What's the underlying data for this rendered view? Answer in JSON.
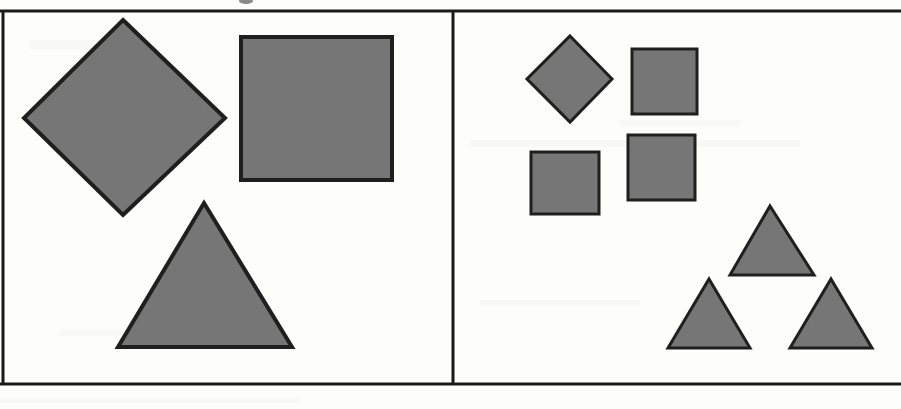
{
  "figure": {
    "title": "",
    "width": 901,
    "height": 409,
    "background_color": "#fdfdfc",
    "shape_fill_color": "#767676",
    "shape_stroke_color": "#1f1f1f",
    "frame_color": "#1a1a1a"
  },
  "frame": {
    "top_rule": {
      "x1": 0,
      "y1": 11,
      "x2": 901,
      "y2": 11,
      "width": 3
    },
    "bottom_rule": {
      "x1": 0,
      "y1": 384,
      "x2": 901,
      "y2": 384,
      "width": 3
    },
    "left_rule": {
      "x1": 3,
      "y1": 11,
      "x2": 3,
      "y2": 384,
      "width": 3
    },
    "divider_rule": {
      "x1": 453,
      "y1": 11,
      "x2": 453,
      "y2": 384,
      "width": 3
    }
  },
  "panels": [
    {
      "name": "left-panel",
      "label": "",
      "shape_count": 3,
      "shapes": [
        {
          "name": "large-diamond",
          "type": "diamond",
          "points": "123,20 225,118 123,215 24,118",
          "stroke_width": 4,
          "size": "large"
        },
        {
          "name": "large-square",
          "type": "square",
          "x": 241,
          "y": 37,
          "width": 151,
          "height": 143,
          "stroke_width": 4,
          "size": "large"
        },
        {
          "name": "large-triangle",
          "type": "triangle",
          "points": "204,203 292,347 118,347",
          "stroke_width": 4,
          "size": "large"
        }
      ]
    },
    {
      "name": "right-panel",
      "label": "",
      "shape_count": 7,
      "shapes": [
        {
          "name": "small-diamond",
          "type": "diamond",
          "points": "570,36 612,79 570,122 527,79",
          "stroke_width": 3,
          "size": "small"
        },
        {
          "name": "small-square-top-right",
          "type": "square",
          "x": 632,
          "y": 49,
          "width": 65,
          "height": 65,
          "stroke_width": 3,
          "size": "small"
        },
        {
          "name": "small-square-middle",
          "type": "square",
          "x": 628,
          "y": 135,
          "width": 67,
          "height": 65,
          "stroke_width": 3,
          "size": "small"
        },
        {
          "name": "small-square-bottom-left",
          "type": "square",
          "x": 531,
          "y": 152,
          "width": 68,
          "height": 62,
          "stroke_width": 3,
          "size": "small"
        },
        {
          "name": "small-triangle-top",
          "type": "triangle",
          "points": "770,206 814,275 730,275",
          "stroke_width": 3,
          "size": "small"
        },
        {
          "name": "small-triangle-bottom-left",
          "type": "triangle",
          "points": "709,279 750,348 668,348",
          "stroke_width": 3,
          "size": "small"
        },
        {
          "name": "small-triangle-bottom-right",
          "type": "triangle",
          "points": "831,279 872,348 790,348",
          "stroke_width": 3,
          "size": "small"
        }
      ]
    }
  ],
  "chart_data": {
    "type": "scatter",
    "title": "",
    "xlabel": "",
    "ylabel": "",
    "categories": [
      "diamond",
      "square",
      "triangle"
    ],
    "series": [
      {
        "name": "left-panel (large shapes)",
        "values": [
          1,
          1,
          1
        ]
      },
      {
        "name": "right-panel (small shapes)",
        "values": [
          1,
          3,
          3
        ]
      }
    ],
    "legend_position": "none",
    "grid": false
  }
}
